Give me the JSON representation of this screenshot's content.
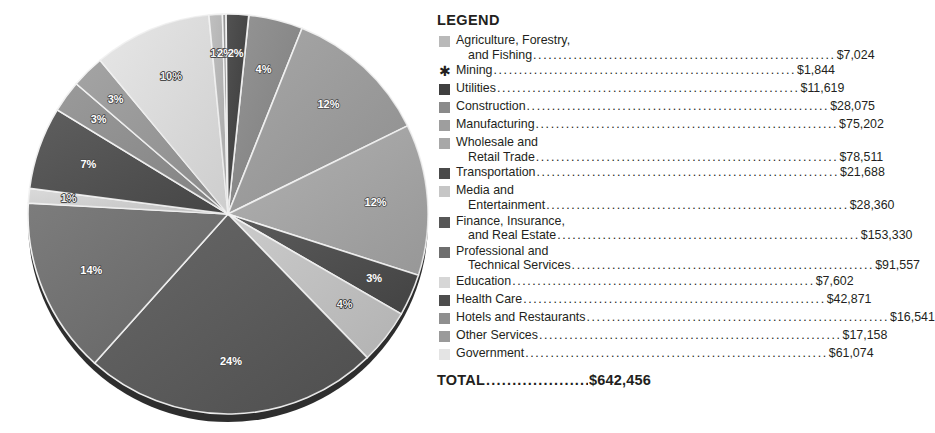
{
  "chart_data": {
    "type": "pie",
    "title": "",
    "total_label": "TOTAL",
    "total_value": "$642,456",
    "units": "thousands of dollars",
    "legend_title": "LEGEND",
    "legend_position": "right",
    "categories": [
      "Agriculture, Forestry, and Fishing",
      "Mining",
      "Utilities",
      "Construction",
      "Manufacturing",
      "Wholesale and Retail Trade",
      "Transportation",
      "Media and Entertainment",
      "Finance, Insurance, and Real Estate",
      "Professional and Technical Services",
      "Education",
      "Health Care",
      "Hotels and Restaurants",
      "Other Services",
      "Government"
    ],
    "values": [
      7024,
      1844,
      11619,
      28075,
      75202,
      78511,
      21688,
      28360,
      153330,
      91557,
      7602,
      42871,
      16541,
      17158,
      61074
    ],
    "percent_labels": [
      "1%",
      "2%",
      "2%",
      "4%",
      "12%",
      "12%",
      "3%",
      "4%",
      "24%",
      "14%",
      "1%",
      "7%",
      "3%",
      "3%",
      "10%"
    ],
    "colors": [
      "#b9b9b9",
      "#8e8e8e",
      "#3f3f3f",
      "#8a8a8a",
      "#9e9e9e",
      "#a8a8a8",
      "#4a4a4a",
      "#c6c6c6",
      "#575757",
      "#6e6e6e",
      "#d6d6d6",
      "#4d4d4d",
      "#8f8f8f",
      "#9a9a9a",
      "#e4e4e4"
    ]
  },
  "legend": {
    "title": "LEGEND",
    "items": [
      {
        "name_line1": "Agriculture, Forestry,",
        "name_line2": "and Fishing",
        "value": "$7,024",
        "swatch": "#b9b9b9",
        "marker": "square"
      },
      {
        "name_line1": "Mining",
        "name_line2": "",
        "value": "$1,844",
        "swatch": "#8e8e8e",
        "marker": "asterisk",
        "marker_glyph": "✱"
      },
      {
        "name_line1": "Utilities",
        "name_line2": "",
        "value": "$11,619",
        "swatch": "#3f3f3f",
        "marker": "square"
      },
      {
        "name_line1": "Construction",
        "name_line2": "",
        "value": "$28,075",
        "swatch": "#8a8a8a",
        "marker": "square"
      },
      {
        "name_line1": "Manufacturing",
        "name_line2": "",
        "value": "$75,202",
        "swatch": "#9e9e9e",
        "marker": "square"
      },
      {
        "name_line1": "Wholesale and",
        "name_line2": "Retail Trade",
        "value": "$78,511",
        "swatch": "#a8a8a8",
        "marker": "square"
      },
      {
        "name_line1": "Transportation",
        "name_line2": "",
        "value": "$21,688",
        "swatch": "#4a4a4a",
        "marker": "square"
      },
      {
        "name_line1": "Media and",
        "name_line2": "Entertainment",
        "value": "$28,360",
        "swatch": "#c6c6c6",
        "marker": "square"
      },
      {
        "name_line1": "Finance, Insurance,",
        "name_line2": "and Real Estate",
        "value": "$153,330",
        "swatch": "#575757",
        "marker": "square"
      },
      {
        "name_line1": "Professional and",
        "name_line2": "Technical Services",
        "value": "$91,557",
        "swatch": "#6e6e6e",
        "marker": "square"
      },
      {
        "name_line1": "Education",
        "name_line2": "",
        "value": "$7,602",
        "swatch": "#d6d6d6",
        "marker": "square"
      },
      {
        "name_line1": "Health Care",
        "name_line2": "",
        "value": "$42,871",
        "swatch": "#4d4d4d",
        "marker": "square"
      },
      {
        "name_line1": "Hotels and Restaurants",
        "name_line2": "",
        "value": "$16,541",
        "swatch": "#8f8f8f",
        "marker": "square"
      },
      {
        "name_line1": "Other Services",
        "name_line2": "",
        "value": "$17,158",
        "swatch": "#9a9a9a",
        "marker": "square"
      },
      {
        "name_line1": "Government",
        "name_line2": "",
        "value": "$61,074",
        "swatch": "#e4e4e4",
        "marker": "square"
      }
    ],
    "total_label": "TOTAL",
    "total_value": "$642,456"
  },
  "pie": {
    "center_x": 228,
    "center_y": 214,
    "radius": 200,
    "slices": [
      {
        "label": "4%",
        "pct": 4.37,
        "color": "#8a8a8a",
        "name": "Construction",
        "label_dark": false
      },
      {
        "label": "12%",
        "pct": 11.7,
        "color": "#9e9e9e",
        "name": "Manufacturing",
        "label_dark": false
      },
      {
        "label": "12%",
        "pct": 12.22,
        "color": "#a8a8a8",
        "name": "Wholesale and Retail Trade",
        "label_dark": false
      },
      {
        "label": "3%",
        "pct": 3.38,
        "color": "#4a4a4a",
        "name": "Transportation",
        "label_dark": false
      },
      {
        "label": "4%",
        "pct": 4.41,
        "color": "#c6c6c6",
        "name": "Media and Entertainment",
        "label_dark": true
      },
      {
        "label": "24%",
        "pct": 23.87,
        "color": "#575757",
        "name": "Finance, Insurance, and Real Estate",
        "label_dark": false
      },
      {
        "label": "14%",
        "pct": 14.25,
        "color": "#6e6e6e",
        "name": "Professional and Technical Services",
        "label_dark": false
      },
      {
        "label": "1%",
        "pct": 1.18,
        "color": "#d6d6d6",
        "name": "Education",
        "label_dark": true
      },
      {
        "label": "7%",
        "pct": 6.67,
        "color": "#4d4d4d",
        "name": "Health Care",
        "label_dark": false
      },
      {
        "label": "3%",
        "pct": 2.57,
        "color": "#8f8f8f",
        "name": "Hotels and Restaurants",
        "label_dark": false
      },
      {
        "label": "3%",
        "pct": 2.67,
        "color": "#9a9a9a",
        "name": "Other Services",
        "label_dark": false
      },
      {
        "label": "10%",
        "pct": 9.51,
        "color": "#e4e4e4",
        "name": "Government",
        "label_dark": true
      },
      {
        "label": "1%",
        "pct": 1.09,
        "color": "#b9b9b9",
        "name": "Agriculture, Forestry, and Fishing",
        "label_dark": true
      },
      {
        "label": "2%",
        "pct": 0.29,
        "color": "#8e8e8e",
        "name": "Mining",
        "label_dark": false
      },
      {
        "label": "2%",
        "pct": 1.81,
        "color": "#3f3f3f",
        "name": "Utilities",
        "label_dark": false
      }
    ]
  }
}
